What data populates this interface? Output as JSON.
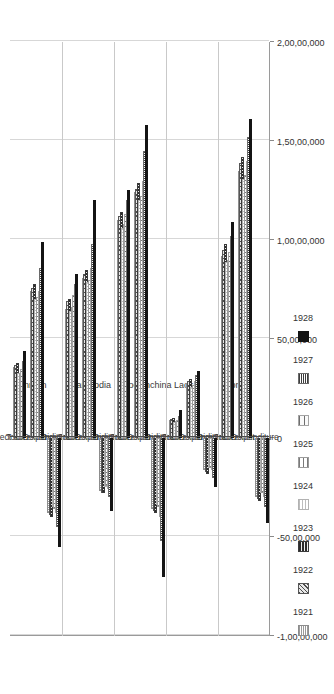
{
  "chart_data": {
    "type": "bar",
    "orientation": "horizontal",
    "title": "",
    "subtitle": "",
    "xlabel": "",
    "ylabel": "",
    "xlim": [
      -10000000,
      20000000
    ],
    "grid": true,
    "legend_position": "bottom",
    "tick_labels": [
      "2,00,00,000",
      "1,50,00,000",
      "1,00,00,000",
      "50,00,000",
      "0",
      "-50,00,000",
      "-1,00,00,000"
    ],
    "tick_values": [
      20000000,
      15000000,
      10000000,
      5000000,
      0,
      -5000000,
      -10000000
    ],
    "legend": [
      "1921",
      "1922",
      "1923",
      "1924",
      "1925",
      "1926",
      "1927",
      "1928"
    ],
    "series_names": [
      "1921",
      "1922",
      "1923",
      "1924",
      "1925",
      "1926",
      "1927",
      "1928"
    ],
    "group_labels": [
      "Annam",
      "Cambodia",
      "Cochinchina",
      "Laos",
      "Tonkin"
    ],
    "category_labels": [
      "Direct tax",
      "Total expenditure",
      "Deficit"
    ],
    "groups": [
      {
        "name": "Annam",
        "categories": [
          {
            "label": "Direct tax",
            "values": [
              3600000,
              3700000,
              3800000,
              3300000,
              3300000,
              3500000,
              3900000,
              4400000
            ]
          },
          {
            "label": "Total expenditure",
            "values": [
              7400000,
              7600000,
              7800000,
              7000000,
              7100000,
              7400000,
              8600000,
              9900000
            ]
          },
          {
            "label": "Deficit",
            "values": [
              -3800000,
              -3900000,
              -4000000,
              -3500000,
              -3600000,
              -3800000,
              -4500000,
              -5500000
            ]
          }
        ]
      },
      {
        "name": "Cambodia",
        "categories": [
          {
            "label": "Direct tax",
            "values": [
              6500000,
              6900000,
              7000000,
              6400000,
              6600000,
              7200000,
              7800000,
              8300000
            ]
          },
          {
            "label": "Total expenditure",
            "values": [
              8100000,
              8300000,
              8500000,
              7900000,
              8000000,
              8600000,
              9800000,
              12000000
            ]
          },
          {
            "label": "Deficit",
            "values": [
              -2700000,
              -2800000,
              -2800000,
              -2500000,
              -2400000,
              -2600000,
              -3000000,
              -3700000
            ]
          }
        ]
      },
      {
        "name": "Cochinchina",
        "categories": [
          {
            "label": "Direct tax",
            "values": [
              11000000,
              11200000,
              11400000,
              10600000,
              10800000,
              11300000,
              12000000,
              12500000
            ]
          },
          {
            "label": "Total expenditure",
            "values": [
              12400000,
              12600000,
              12900000,
              12000000,
              12200000,
              13000000,
              14500000,
              15800000
            ]
          },
          {
            "label": "Deficit",
            "values": [
              -3600000,
              -3700000,
              -3800000,
              -3400000,
              -3500000,
              -4000000,
              -5200000,
              -7000000
            ]
          }
        ]
      },
      {
        "name": "Laos",
        "categories": [
          {
            "label": "Direct tax",
            "values": [
              900000,
              950000,
              1000000,
              800000,
              850000,
              900000,
              1100000,
              1400000
            ]
          },
          {
            "label": "Total expenditure",
            "values": [
              2800000,
              2900000,
              3000000,
              2600000,
              2700000,
              2900000,
              3200000,
              3400000
            ]
          },
          {
            "label": "Deficit",
            "values": [
              -1600000,
              -1700000,
              -1800000,
              -1500000,
              -1500000,
              -1600000,
              -2000000,
              -2500000
            ]
          }
        ]
      },
      {
        "name": "Tonkin",
        "categories": [
          {
            "label": "Direct tax",
            "values": [
              9200000,
              9500000,
              9800000,
              8900000,
              9000000,
              9400000,
              10200000,
              10900000
            ]
          },
          {
            "label": "Total expenditure",
            "values": [
              13500000,
              13900000,
              14200000,
              13100000,
              13300000,
              14000000,
              15200000,
              16100000
            ]
          },
          {
            "label": "Deficit",
            "values": [
              -3000000,
              -3100000,
              -3200000,
              -2800000,
              -2800000,
              -3000000,
              -3500000,
              -4300000
            ]
          }
        ]
      }
    ]
  }
}
